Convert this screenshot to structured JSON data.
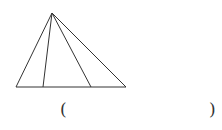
{
  "figure": {
    "apex": [
      52,
      13
    ],
    "base_left": [
      16,
      87
    ],
    "base_right": [
      126,
      87
    ],
    "inner_base_points": [
      [
        43,
        87
      ],
      [
        91,
        87
      ]
    ],
    "stroke_color": "#333333"
  },
  "answer_blank": {
    "open_paren": "(",
    "close_paren": ")"
  }
}
